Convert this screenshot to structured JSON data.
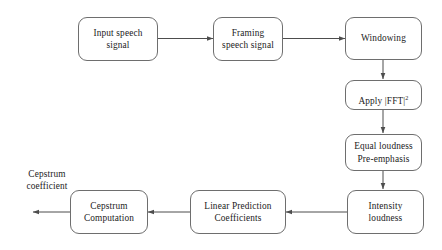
{
  "diagram": {
    "background_color": "#ffffff",
    "box_border_color": "#6e6e6e",
    "arrow_color": "#4d4d4d",
    "text_color": "#222222",
    "nodes": [
      {
        "id": "input_speech_signal",
        "label": "Input speech\nsignal"
      },
      {
        "id": "framing_speech_signal",
        "label": "Framing\nspeech signal"
      },
      {
        "id": "windowing",
        "label": "Windowing"
      },
      {
        "id": "apply_fft",
        "label": "Apply |FFT|",
        "superscript": "2"
      },
      {
        "id": "equal_loudness_pre_emphasis",
        "label": "Equal loudness\nPre-emphasis"
      },
      {
        "id": "intensity_loudness",
        "label": "Intensity\nloudness"
      },
      {
        "id": "linear_prediction_coefficients",
        "label": "Linear Prediction\nCoefficients"
      },
      {
        "id": "cepstrum_computation",
        "label": "Cepstrum\nComputation"
      }
    ],
    "output_label": "Cepstrum\ncoefficient",
    "edges": [
      {
        "from": "input_speech_signal",
        "to": "framing_speech_signal",
        "direction": "right"
      },
      {
        "from": "framing_speech_signal",
        "to": "windowing",
        "direction": "right"
      },
      {
        "from": "windowing",
        "to": "apply_fft",
        "direction": "down"
      },
      {
        "from": "apply_fft",
        "to": "equal_loudness_pre_emphasis",
        "direction": "down"
      },
      {
        "from": "equal_loudness_pre_emphasis",
        "to": "intensity_loudness",
        "direction": "down"
      },
      {
        "from": "intensity_loudness",
        "to": "linear_prediction_coefficients",
        "direction": "left"
      },
      {
        "from": "linear_prediction_coefficients",
        "to": "cepstrum_computation",
        "direction": "left"
      },
      {
        "from": "cepstrum_computation",
        "to": "output_label",
        "direction": "left"
      }
    ]
  }
}
